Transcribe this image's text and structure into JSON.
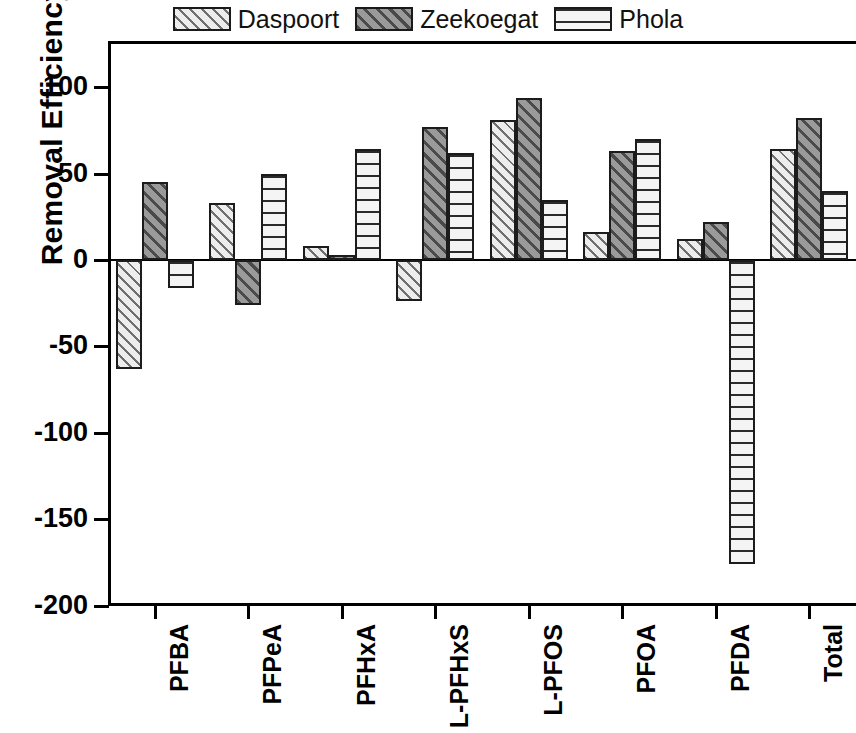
{
  "chart_data": {
    "type": "bar",
    "title": "",
    "subtitle": "",
    "xlabel": "",
    "ylabel": "Removal Efficiency (%)",
    "categories": [
      "PFBA",
      "PFPeA",
      "PFHxA",
      "L-PFHxS",
      "L-PFOS",
      "PFOA",
      "PFDA",
      "Total"
    ],
    "series": [
      {
        "name": "Daspoort",
        "values": [
          -63,
          33,
          8,
          -24,
          81,
          16,
          12,
          64
        ]
      },
      {
        "name": "Zeekoegat",
        "values": [
          45,
          -26,
          3,
          77,
          94,
          63,
          22,
          82
        ]
      },
      {
        "name": "Phola",
        "values": [
          -16,
          50,
          64,
          62,
          35,
          70,
          -176,
          40
        ]
      }
    ],
    "ylim": [
      -200,
      126
    ],
    "yticks": [
      100,
      50,
      0,
      -50,
      -100,
      -150,
      -200
    ],
    "ytick_labels": [
      "100",
      "50",
      "0",
      "-50",
      "-100",
      "-150",
      "-200"
    ],
    "grid": false,
    "legend_position": "top-center",
    "legend": [
      {
        "label": "Daspoort",
        "pattern": "diagonal-hatch-light"
      },
      {
        "label": "Zeekoegat",
        "pattern": "diagonal-hatch-dark"
      },
      {
        "label": "Phola",
        "pattern": "horizontal-hatch-light"
      }
    ],
    "colors": {
      "daspoort": "#e9e9e9",
      "zeekoegat": "#8d8d8d",
      "phola": "#f2f2f2",
      "outline": "#1c1c1c",
      "axis": "#000000"
    }
  }
}
